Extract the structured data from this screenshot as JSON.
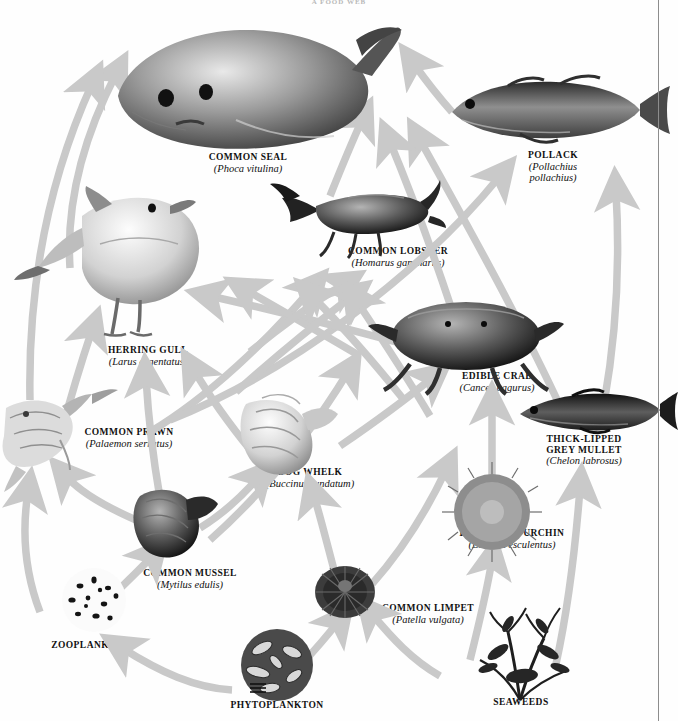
{
  "figure": {
    "kind": "marine-food-web-diagram",
    "title_fragment": "A FOOD WEB",
    "arrow_color": "#c9c9c9",
    "arrow_meaning": "energy flow from prey to predator",
    "background": "#ffffff",
    "margin_rule_color": "#8d8d8d"
  },
  "organisms": [
    {
      "id": "common-seal",
      "common": "COMMON SEAL",
      "sci": "(Phoca vitulina)",
      "trophic_level": "top predator",
      "label_x": 248,
      "label_y": 152
    },
    {
      "id": "pollack",
      "common": "POLLACK",
      "sci_lines": [
        "(Pollachius",
        "pollachius)"
      ],
      "trophic_level": "predatory fish",
      "label_x": 553,
      "label_y": 150
    },
    {
      "id": "common-lobster",
      "common": "COMMON LOBSTER",
      "sci": "(Homarus gammarus)",
      "trophic_level": "crustacean predator",
      "label_x": 398,
      "label_y": 246
    },
    {
      "id": "herring-gull",
      "common": "HERRING GULL",
      "sci": "(Larus argentatus)",
      "trophic_level": "top predator",
      "label_x": 148,
      "label_y": 345
    },
    {
      "id": "edible-crab",
      "common": "EDIBLE CRAB",
      "sci": "(Cancer pagurus)",
      "trophic_level": "crustacean predator",
      "label_x": 497,
      "label_y": 371
    },
    {
      "id": "thick-lipped-grey-mullet",
      "common_lines": [
        "THICK-LIPPED",
        "GREY MULLET"
      ],
      "sci": "(Chelon labrosus)",
      "trophic_level": "grazing fish",
      "label_x": 584,
      "label_y": 434
    },
    {
      "id": "common-prawn",
      "common": "COMMON PRAWN",
      "sci": "(Palaemon serratus)",
      "trophic_level": "crustacean",
      "label_x": 129,
      "label_y": 427
    },
    {
      "id": "dog-whelk",
      "common": "DOG WHELK",
      "sci": "(Buccinum undatum)",
      "trophic_level": "predatory mollusc",
      "label_x": 310,
      "label_y": 467
    },
    {
      "id": "edible-sea-urchin",
      "common": "EDIBLE SEA URCHIN",
      "sci": "(Echinus esculentus)",
      "trophic_level": "grazer",
      "label_x": 512,
      "label_y": 528
    },
    {
      "id": "common-mussel",
      "common": "COMMON MUSSEL",
      "sci": "(Mytilus edulis)",
      "trophic_level": "filter feeder",
      "label_x": 190,
      "label_y": 568
    },
    {
      "id": "common-limpet",
      "common": "COMMON LIMPET",
      "sci": "(Patella vulgata)",
      "trophic_level": "grazer",
      "label_x": 428,
      "label_y": 603
    },
    {
      "id": "zooplankton",
      "common": "ZOOPLANKTON",
      "sci": "",
      "trophic_level": "primary consumer",
      "label_x": 91,
      "label_y": 640
    },
    {
      "id": "phytoplankton",
      "common": "PHYTOPLANKTON",
      "sci": "",
      "trophic_level": "primary producer",
      "label_x": 277,
      "label_y": 700
    },
    {
      "id": "seaweeds",
      "common": "SEAWEEDS",
      "sci": "",
      "trophic_level": "primary producer",
      "label_x": 521,
      "label_y": 697
    }
  ],
  "food_web_links": [
    {
      "from": "phytoplankton",
      "to": "zooplankton"
    },
    {
      "from": "phytoplankton",
      "to": "common-mussel"
    },
    {
      "from": "phytoplankton",
      "to": "common-limpet"
    },
    {
      "from": "seaweeds",
      "to": "common-limpet"
    },
    {
      "from": "seaweeds",
      "to": "edible-sea-urchin"
    },
    {
      "from": "seaweeds",
      "to": "thick-lipped-grey-mullet"
    },
    {
      "from": "zooplankton",
      "to": "common-prawn"
    },
    {
      "from": "zooplankton",
      "to": "common-mussel"
    },
    {
      "from": "common-mussel",
      "to": "dog-whelk"
    },
    {
      "from": "common-mussel",
      "to": "edible-crab"
    },
    {
      "from": "common-mussel",
      "to": "herring-gull"
    },
    {
      "from": "common-limpet",
      "to": "dog-whelk"
    },
    {
      "from": "common-limpet",
      "to": "herring-gull"
    },
    {
      "from": "common-prawn",
      "to": "herring-gull"
    },
    {
      "from": "common-prawn",
      "to": "pollack"
    },
    {
      "from": "common-prawn",
      "to": "common-lobster"
    },
    {
      "from": "dog-whelk",
      "to": "herring-gull"
    },
    {
      "from": "dog-whelk",
      "to": "edible-crab"
    },
    {
      "from": "edible-sea-urchin",
      "to": "edible-crab"
    },
    {
      "from": "edible-crab",
      "to": "common-seal"
    },
    {
      "from": "edible-crab",
      "to": "herring-gull"
    },
    {
      "from": "common-lobster",
      "to": "common-seal"
    },
    {
      "from": "pollack",
      "to": "common-seal"
    },
    {
      "from": "thick-lipped-grey-mullet",
      "to": "common-seal"
    },
    {
      "from": "thick-lipped-grey-mullet",
      "to": "pollack"
    },
    {
      "from": "common-mussel",
      "to": "common-lobster"
    }
  ]
}
